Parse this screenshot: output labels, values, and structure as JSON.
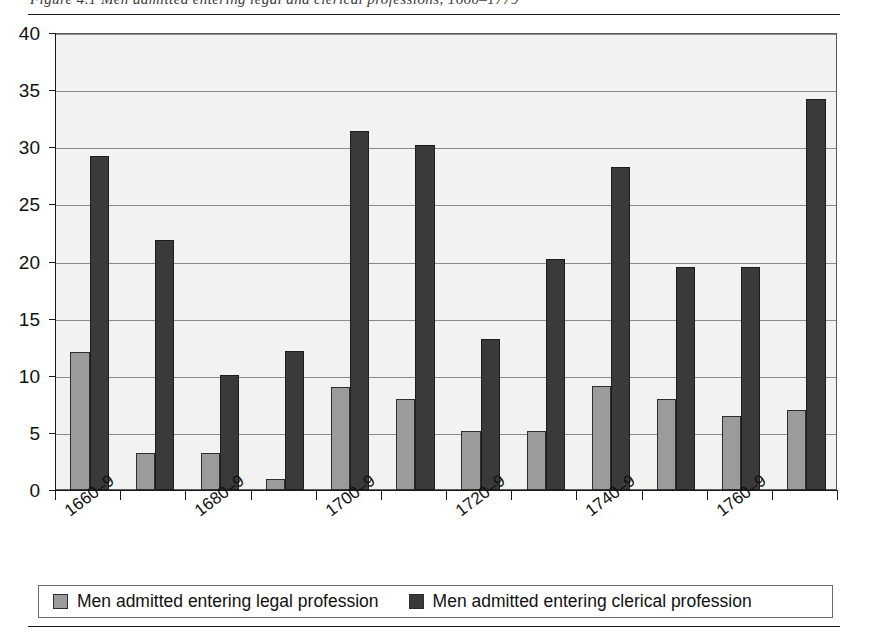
{
  "figure": {
    "caption_clipped": "Figure 4.1  Men admitted entering legal and clerical professions, 1660–1779",
    "legend": {
      "entries": [
        {
          "label": "Men admitted entering legal profession",
          "color": "#9b9b9b",
          "swatch_name": "legal-swatch"
        },
        {
          "label": "Men admitted entering clerical profession",
          "color": "#3a3a3a",
          "swatch_name": "clerical-swatch"
        }
      ]
    }
  },
  "chart_data": {
    "type": "bar",
    "title": "",
    "xlabel": "",
    "ylabel": "",
    "ylim": [
      0,
      40
    ],
    "yticks": [
      0,
      5,
      10,
      15,
      20,
      25,
      30,
      35,
      40
    ],
    "grid": true,
    "legend_position": "bottom",
    "categories": [
      "1660–9",
      "1670–9",
      "1680–9",
      "1690–9",
      "1700–9",
      "1710–9",
      "1720–9",
      "1730–9",
      "1740–9",
      "1750–9",
      "1760–9",
      "1770–9"
    ],
    "tick_labels_shown": [
      "1660–9",
      "",
      "1680–9",
      "",
      "1700–9",
      "",
      "1720–9",
      "",
      "1740–9",
      "",
      "1760–9",
      ""
    ],
    "series": [
      {
        "name": "Men admitted entering legal profession",
        "color": "#9b9b9b",
        "values": [
          12.1,
          3.2,
          3.2,
          1.0,
          9.0,
          8.0,
          5.2,
          5.2,
          9.1,
          8.0,
          6.5,
          7.0
        ]
      },
      {
        "name": "Men admitted entering clerical profession",
        "color": "#3a3a3a",
        "values": [
          29.2,
          21.9,
          10.1,
          12.2,
          31.4,
          30.2,
          13.2,
          20.2,
          28.3,
          19.5,
          19.5,
          34.2
        ]
      }
    ]
  }
}
